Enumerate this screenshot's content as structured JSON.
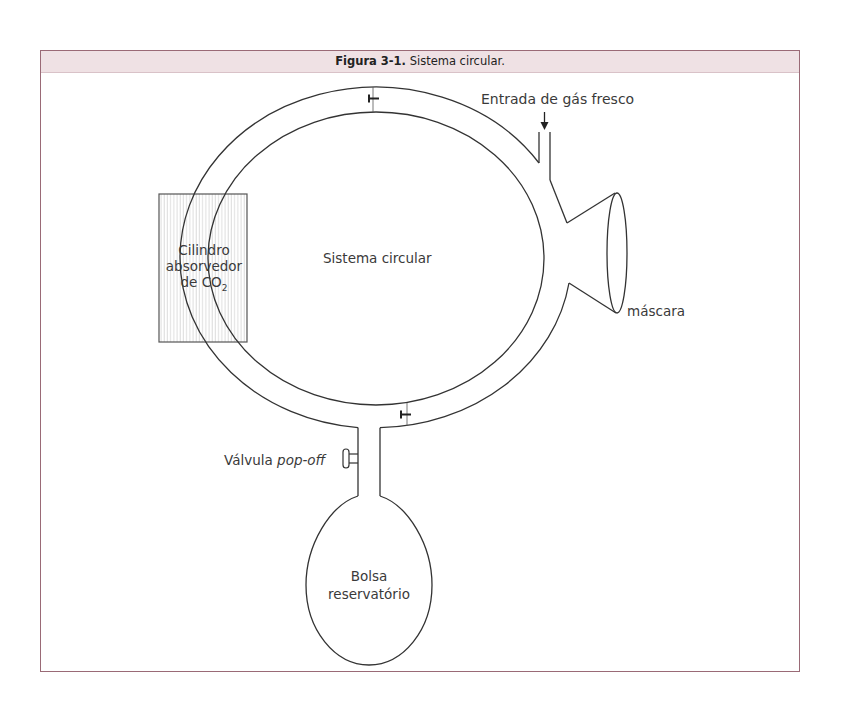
{
  "figure": {
    "number_label": "Figura 3-1.",
    "title": "Sistema circular."
  },
  "labels": {
    "fresh_gas_inlet": "Entrada de gás fresco",
    "circle_system": "Sistema circular",
    "absorber_line1": "Cilindro",
    "absorber_line2": "absorvedor",
    "absorber_line3_prefix": "de CO",
    "absorber_line3_sub": "2",
    "mask": "máscara",
    "popoff_prefix": "Válvula ",
    "popoff_italic": "pop-off",
    "bag_line1": "Bolsa",
    "bag_line2": "reservatório"
  },
  "colors": {
    "frame_border": "#9a6a76",
    "title_band_bg": "#efe1e4",
    "line": "#333333",
    "hatch": "#cfcfcf"
  }
}
